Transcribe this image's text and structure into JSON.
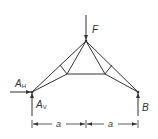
{
  "diagram": {
    "type": "truss-structure",
    "labels": {
      "force": "F",
      "support_a_horizontal": "A",
      "support_a_horizontal_sub": "H",
      "support_a_vertical": "A",
      "support_a_vertical_sub": "V",
      "support_b": "B",
      "dimension_left": "a",
      "dimension_right": "a"
    },
    "colors": {
      "line": "#333333",
      "background": "#ffffff"
    }
  }
}
